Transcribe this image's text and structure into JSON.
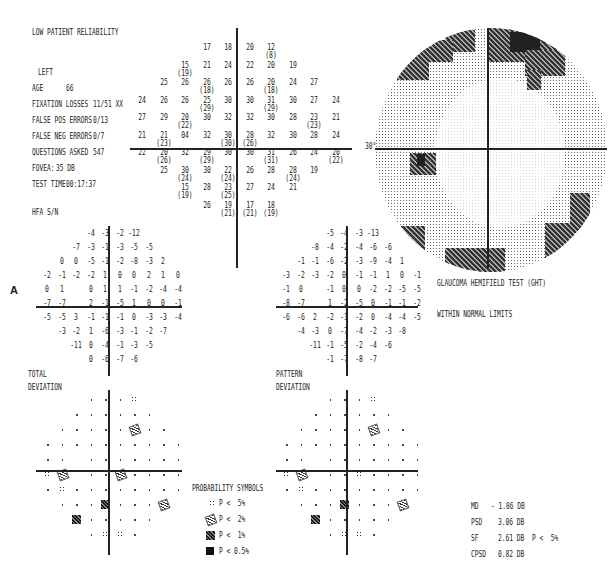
{
  "header": {
    "reliability_warning": "LOW PATIENT RELIABILITY",
    "eye": "LEFT",
    "age_label": "AGE",
    "age_value": "66",
    "fixation_losses_label": "FIXATION LOSSES",
    "fixation_losses_value": "11/51 XX",
    "false_pos_label": "FALSE POS ERRORS",
    "false_pos_value": "0/13",
    "false_neg_label": "FALSE NEG ERRORS",
    "false_neg_value": "0/7",
    "questions_label": "QUESTIONS ASKED",
    "questions_value": "547",
    "fovea_label": "FOVEA:",
    "fovea_value": "35 DB",
    "test_time_label": "TEST TIME",
    "test_time_value": "00:17:37",
    "hfa_sn": "HFA S/N"
  },
  "figure_label": "A",
  "greyscale": {
    "degree_label": "30°"
  },
  "ght": {
    "title": "GLAUCOMA HEMIFIELD TEST (GHT)",
    "result": "WITHIN NORMAL LIMITS"
  },
  "total_deviation": {
    "label1": "TOTAL",
    "label2": "DEVIATION"
  },
  "pattern_deviation": {
    "label1": "PATTERN",
    "label2": "DEVIATION"
  },
  "probability_symbols": {
    "title": "PROBABILITY SYMBOLS",
    "items": [
      {
        "symbol": "dots",
        "text": "P <  5%"
      },
      {
        "symbol": "hatch",
        "text": "P <  2%"
      },
      {
        "symbol": "dense",
        "text": "P <  1%"
      },
      {
        "symbol": "solid",
        "text": "P < 0.5%"
      }
    ]
  },
  "indices": {
    "md_label": "MD",
    "md_value": "- 1.86 DB",
    "psd_label": "PSD",
    "psd_value": "3.06 DB",
    "sf_label": "SF",
    "sf_value": "2.61 DB",
    "sf_p": "P <  5%",
    "cpsd_label": "CPSD",
    "cpsd_value": "0.82 DB"
  },
  "chart_data": [
    {
      "type": "table",
      "title": "Threshold values (dB), repeated values in parentheses",
      "rows": [
        [
          "",
          "",
          "",
          "17",
          "18",
          "20",
          "12 (8)",
          "",
          "",
          ""
        ],
        [
          "",
          "",
          "15 (19)",
          "21",
          "24",
          "22",
          "20",
          "19",
          "",
          ""
        ],
        [
          "",
          "25",
          "26",
          "26 (18)",
          "26",
          "26",
          "20 (18)",
          "24",
          "27",
          ""
        ],
        [
          "24",
          "26",
          "26",
          "25 (29)",
          "30",
          "30",
          "31 (29)",
          "30",
          "27",
          "24"
        ],
        [
          "27",
          "29",
          "20 (22)",
          "30",
          "32",
          "32",
          "30",
          "28",
          "23 (23)",
          "21"
        ],
        [
          "21",
          "21 (23)",
          "04",
          "32",
          "30 (30)",
          "28 (26)",
          "32",
          "30",
          "28",
          "24"
        ],
        [
          "22",
          "20 (26)",
          "32",
          "29 (29)",
          "30",
          "30",
          "31 (31)",
          "26",
          "24",
          "20 (22)"
        ],
        [
          "",
          "25",
          "30 (24)",
          "30",
          "22 (24)",
          "26",
          "28",
          "28 (24)",
          "19",
          ""
        ],
        [
          "",
          "",
          "15 (19)",
          "28",
          "23 (25)",
          "27",
          "24",
          "21",
          "",
          ""
        ],
        [
          "",
          "",
          "",
          "26",
          "19 (21)",
          "17 (21)",
          "18 (19)",
          "",
          "",
          ""
        ]
      ]
    },
    {
      "type": "table",
      "title": "Total Deviation",
      "rows": [
        [
          "",
          "",
          "",
          "-4",
          "-3",
          "-2",
          "-12",
          "",
          "",
          ""
        ],
        [
          "",
          "",
          "-7",
          "-3",
          "-1",
          "-3",
          "-5",
          "-5",
          "",
          ""
        ],
        [
          "",
          "0",
          "0",
          "-5",
          "-1",
          "-2",
          "-8",
          "-3",
          "2",
          ""
        ],
        [
          "-2",
          "-1",
          "-2",
          "-2",
          "1",
          "0",
          "0",
          "2",
          "1",
          "0"
        ],
        [
          "0",
          "1",
          "",
          "0",
          "1",
          "1",
          "-1",
          "-2",
          "-4",
          "-4"
        ],
        [
          "-7",
          "-7",
          "",
          "2",
          "-1",
          "-5",
          "1",
          "0",
          "0",
          "-1"
        ],
        [
          "-5",
          "-5",
          "3",
          "-1",
          "-1",
          "-1",
          "0",
          "-3",
          "-3",
          "-4"
        ],
        [
          "",
          "-3",
          "-2",
          "1",
          "-6",
          "-3",
          "-1",
          "-2",
          "-7",
          ""
        ],
        [
          "",
          "",
          "-11",
          "0",
          "-4",
          "-1",
          "-3",
          "-5",
          "",
          ""
        ],
        [
          "",
          "",
          "",
          "0",
          "-6",
          "-7",
          "-6",
          "",
          "",
          ""
        ]
      ]
    },
    {
      "type": "table",
      "title": "Pattern Deviation",
      "rows": [
        [
          "",
          "",
          "",
          "-5",
          "-4",
          "-3",
          "-13",
          "",
          "",
          ""
        ],
        [
          "",
          "",
          "-8",
          "-4",
          "-2",
          "-4",
          "-6",
          "-6",
          "",
          ""
        ],
        [
          "",
          "-1",
          "-1",
          "-6",
          "-2",
          "-3",
          "-9",
          "-4",
          "1",
          ""
        ],
        [
          "-3",
          "-2",
          "-3",
          "-2",
          "0",
          "-1",
          "-1",
          "1",
          "0",
          "-1"
        ],
        [
          "-1",
          "0",
          "",
          "-1",
          "0",
          "0",
          "-2",
          "-2",
          "-5",
          "-5"
        ],
        [
          "-8",
          "-7",
          "",
          "1",
          "-2",
          "-5",
          "0",
          "-1",
          "-1",
          "-2"
        ],
        [
          "-6",
          "-6",
          "2",
          "-2",
          "-1",
          "-2",
          "0",
          "-4",
          "-4",
          "-5"
        ],
        [
          "",
          "-4",
          "-3",
          "0",
          "-7",
          "-4",
          "-2",
          "-3",
          "-8",
          ""
        ],
        [
          "",
          "",
          "-11",
          "-1",
          "-5",
          "-2",
          "-4",
          "-6",
          "",
          ""
        ],
        [
          "",
          "",
          "",
          "-1",
          "-7",
          "-8",
          "-7",
          "",
          "",
          ""
        ]
      ]
    }
  ]
}
